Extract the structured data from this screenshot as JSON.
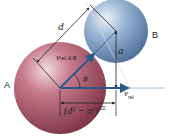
{
  "diagram": {
    "spheres": [
      {
        "id": "A",
        "label": "A",
        "color": "#a85468"
      },
      {
        "id": "B",
        "label": "B",
        "color": "#7c9cc4"
      }
    ],
    "labels": {
      "sphere_a": "A",
      "sphere_b": "B",
      "distance": "d",
      "impact_parameter": "a",
      "relative_velocity_ab": "v",
      "relative_velocity_ab_sub": "rel, A-B",
      "angle": "θ",
      "relative_velocity": "v",
      "relative_velocity_sub": "rel",
      "horizontal_distance": "(d² − a²)",
      "horizontal_distance_exp": "1/2"
    },
    "colors": {
      "arrow": "#2a5a8c",
      "line": "#222222",
      "axis": "#8ab0d0"
    }
  }
}
